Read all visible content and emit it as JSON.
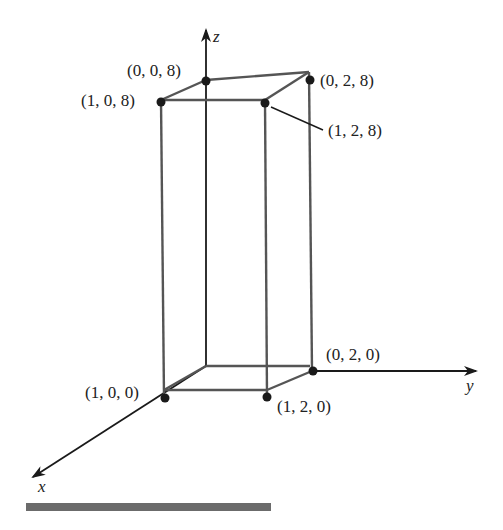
{
  "figure": {
    "type": "3d-rectangular-box",
    "axes": {
      "x": {
        "label": "x"
      },
      "y": {
        "label": "y"
      },
      "z": {
        "label": "z"
      }
    },
    "vertices": [
      {
        "id": "v008",
        "label": "(0, 0, 8)",
        "coords": [
          0,
          0,
          8
        ]
      },
      {
        "id": "v108",
        "label": "(1, 0, 8)",
        "coords": [
          1,
          0,
          8
        ]
      },
      {
        "id": "v028",
        "label": "(0, 2, 8)",
        "coords": [
          0,
          2,
          8
        ]
      },
      {
        "id": "v128",
        "label": "(1, 2, 8)",
        "coords": [
          1,
          2,
          8
        ]
      },
      {
        "id": "v100",
        "label": "(1, 0, 0)",
        "coords": [
          1,
          0,
          0
        ]
      },
      {
        "id": "v020",
        "label": "(0, 2, 0)",
        "coords": [
          0,
          2,
          0
        ]
      },
      {
        "id": "v120",
        "label": "(1, 2, 0)",
        "coords": [
          1,
          2,
          0
        ]
      }
    ],
    "colors": {
      "box_edge": "#555555",
      "axis": "#1a1a1a",
      "bottom_bar": "#6b6b6b"
    }
  }
}
